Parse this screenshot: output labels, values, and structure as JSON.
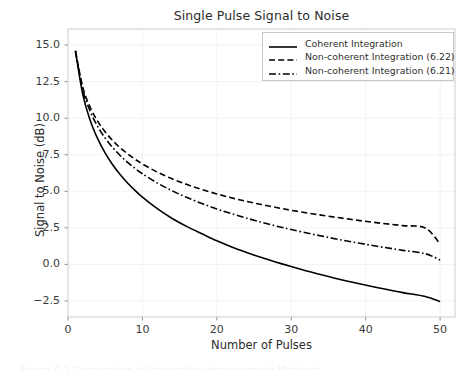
{
  "chart_data": {
    "type": "line",
    "title": "Single Pulse Signal to Noise",
    "xlabel": "Number of Pulses",
    "ylabel": "Signal to Noise (dB)",
    "xlim": [
      0,
      52
    ],
    "ylim": [
      -3.6,
      16.1
    ],
    "xticks": [
      0,
      10,
      20,
      30,
      40,
      50
    ],
    "yticks": [
      -2.5,
      0.0,
      2.5,
      5.0,
      7.5,
      10.0,
      12.5,
      15.0
    ],
    "xtick_labels": [
      "0",
      "10",
      "20",
      "30",
      "40",
      "50"
    ],
    "ytick_labels": [
      "-2.5",
      "0.0",
      "2.5",
      "5.0",
      "7.5",
      "10.0",
      "12.5",
      "15.0"
    ],
    "grid": true,
    "legend_position": "upper right",
    "x": [
      1,
      2,
      3,
      4,
      5,
      6,
      7,
      8,
      9,
      10,
      12,
      14,
      16,
      18,
      20,
      22,
      24,
      26,
      28,
      30,
      33,
      36,
      39,
      42,
      45,
      48,
      50
    ],
    "series": [
      {
        "name": "Coherent Integration",
        "linestyle": "solid",
        "color": "#000000",
        "values": [
          14.6,
          11.59,
          9.83,
          8.58,
          7.61,
          6.82,
          6.15,
          5.57,
          5.06,
          4.6,
          3.81,
          3.14,
          2.58,
          2.09,
          1.61,
          1.19,
          0.82,
          0.47,
          0.15,
          -0.15,
          -0.58,
          -0.96,
          -1.31,
          -1.63,
          -1.93,
          -2.2,
          -2.55
        ]
      },
      {
        "name": "Non-coherent Integration (6.22)",
        "linestyle": "dashed",
        "color": "#000000",
        "values": [
          14.6,
          12.09,
          10.73,
          9.78,
          9.06,
          8.47,
          7.98,
          7.56,
          7.19,
          6.87,
          6.31,
          5.85,
          5.46,
          5.12,
          4.82,
          4.55,
          4.31,
          4.09,
          3.89,
          3.7,
          3.45,
          3.22,
          3.01,
          2.82,
          2.65,
          2.49,
          1.4
        ]
      },
      {
        "name": "Non-coherent Integration (6.21)",
        "linestyle": "dashdot",
        "color": "#000000",
        "values": [
          14.6,
          11.92,
          10.45,
          9.42,
          8.63,
          7.99,
          7.45,
          6.98,
          6.57,
          6.2,
          5.56,
          5.03,
          4.57,
          4.16,
          3.79,
          3.46,
          3.16,
          2.88,
          2.62,
          2.38,
          2.05,
          1.74,
          1.46,
          1.2,
          0.96,
          0.73,
          0.3
        ]
      }
    ]
  },
  "axes": {
    "frame_color": "#cccccc",
    "grid_color": "#f2f2f2",
    "tick_color": "#8c8c8c"
  },
  "caption": {
    "sliver_text": "Figure 6.2 Comparison of Integration Improvement Methods"
  }
}
